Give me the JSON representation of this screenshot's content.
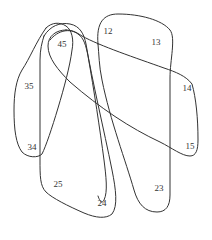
{
  "diagram": {
    "type": "euler-hypergraph",
    "line_color": "#333333",
    "background": "#ffffff",
    "curves": [
      {
        "id": "curve-right-1",
        "contains": [
          "12",
          "13",
          "14",
          "15"
        ]
      },
      {
        "id": "curve-left-3",
        "contains": [
          "35",
          "34"
        ]
      },
      {
        "id": "curve-tall-2",
        "contains": [
          "45",
          "25",
          "24"
        ]
      },
      {
        "id": "curve-diagonal",
        "contains": [
          "45",
          "14",
          "15"
        ]
      },
      {
        "id": "curve-thin-2",
        "contains": [
          "12",
          "23"
        ]
      }
    ],
    "labels": [
      {
        "text": "45",
        "x": 62,
        "y": 44
      },
      {
        "text": "12",
        "x": 108,
        "y": 31
      },
      {
        "text": "13",
        "x": 156,
        "y": 42
      },
      {
        "text": "35",
        "x": 29,
        "y": 86
      },
      {
        "text": "14",
        "x": 187,
        "y": 88
      },
      {
        "text": "34",
        "x": 32,
        "y": 147
      },
      {
        "text": "15",
        "x": 190,
        "y": 146
      },
      {
        "text": "25",
        "x": 58,
        "y": 184
      },
      {
        "text": "23",
        "x": 159,
        "y": 188
      },
      {
        "text": "24",
        "x": 102,
        "y": 203
      }
    ]
  }
}
